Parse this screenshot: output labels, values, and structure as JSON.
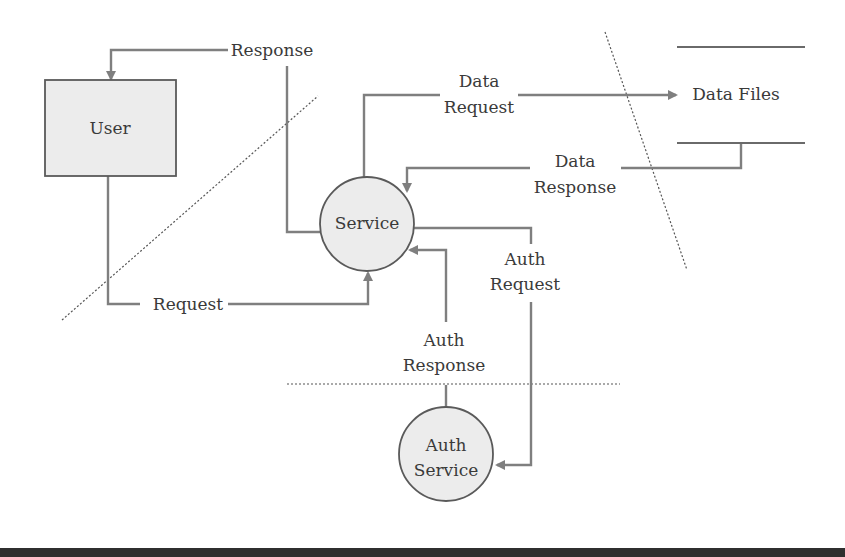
{
  "diagram": {
    "type": "data-flow-diagram",
    "colors": {
      "flow_line": "#7f7f7f",
      "node_fill": "#ececec",
      "node_stroke": "#5a5a5a",
      "text": "#3a3a3a",
      "footer_bar": "#2f2f2f"
    },
    "nodes": {
      "user": {
        "label": "User",
        "shape": "rectangle"
      },
      "service": {
        "label": "Service",
        "shape": "circle"
      },
      "auth_service": {
        "line1": "Auth",
        "line2": "Service",
        "shape": "circle"
      },
      "data_files": {
        "label": "Data Files",
        "shape": "data-store"
      }
    },
    "flows": {
      "response": {
        "label": "Response",
        "from": "Service",
        "to": "User"
      },
      "request": {
        "label": "Request",
        "from": "User",
        "to": "Service"
      },
      "data_request": {
        "line1": "Data",
        "line2": "Request",
        "from": "Service",
        "to": "Data Files"
      },
      "data_response": {
        "line1": "Data",
        "line2": "Response",
        "from": "Data Files",
        "to": "Service"
      },
      "auth_request": {
        "line1": "Auth",
        "line2": "Request",
        "from": "Service",
        "to": "Auth Service"
      },
      "auth_response": {
        "line1": "Auth",
        "line2": "Response",
        "from": "Auth Service",
        "to": "Service"
      }
    },
    "trust_boundaries": [
      {
        "name": "user-boundary",
        "style": "dotted-diagonal"
      },
      {
        "name": "data-store-boundary",
        "style": "dotted-diagonal"
      },
      {
        "name": "auth-boundary",
        "style": "dotted-horizontal"
      }
    ]
  }
}
